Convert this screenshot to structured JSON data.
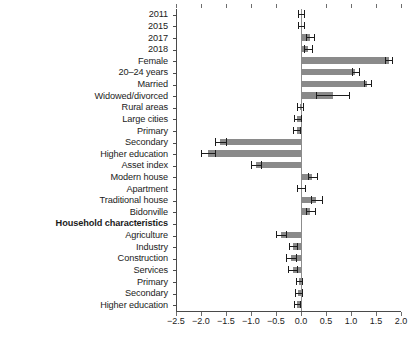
{
  "chart_data": {
    "type": "bar",
    "orientation": "horizontal",
    "title": "",
    "subtitle": "",
    "xlabel": "",
    "ylabel": "",
    "xlim": [
      -2.5,
      2.0
    ],
    "xticks": [
      -2.5,
      -2.0,
      -1.5,
      -1.0,
      -0.5,
      0.0,
      0.5,
      1.0,
      1.5,
      2.0
    ],
    "xticklabels": [
      "−2.5",
      "−2.0",
      "−1.5",
      "−1.0",
      "−0.5",
      "0.0",
      "0.5",
      "1.0",
      "1.5",
      "2.0"
    ],
    "grid": false,
    "legend": false,
    "zero_reference_line": 0.0,
    "bar_color": "#8a8a8a",
    "error_bar_color": "#1c1c1c",
    "categories": [
      "2011",
      "2015",
      "2017",
      "2018",
      "Female",
      "20–24 years",
      "Married",
      "Widowed/divorced",
      "Rural areas",
      "Large cities",
      "Primary",
      "Secondary",
      "Higher education",
      "Asset index",
      "Modern house",
      "Apartment",
      "Traditional house",
      "Bidonville",
      "Household characteristics",
      "Agriculture",
      "Industry",
      "Construction",
      "Services",
      "Primary",
      "Secondary",
      "Higher education"
    ],
    "values": [
      0.0,
      0.0,
      0.17,
      0.13,
      1.75,
      1.08,
      1.32,
      0.63,
      -0.02,
      -0.08,
      -0.09,
      -1.62,
      -1.86,
      -0.9,
      0.22,
      0.0,
      0.3,
      0.18,
      null,
      -0.4,
      -0.16,
      -0.2,
      -0.17,
      -0.04,
      -0.06,
      -0.08
    ],
    "error_low": [
      -0.07,
      -0.07,
      0.09,
      0.05,
      1.68,
      1.01,
      1.25,
      0.3,
      -0.08,
      -0.15,
      -0.16,
      -1.73,
      -2.0,
      -1.0,
      0.14,
      -0.08,
      0.2,
      0.1,
      null,
      -0.5,
      -0.24,
      -0.3,
      -0.26,
      -0.1,
      -0.13,
      -0.14
    ],
    "error_high": [
      0.05,
      0.05,
      0.25,
      0.21,
      1.82,
      1.15,
      1.39,
      0.96,
      0.04,
      -0.01,
      -0.02,
      -1.51,
      -1.72,
      -0.8,
      0.31,
      0.07,
      0.41,
      0.27,
      null,
      -0.31,
      -0.08,
      -0.11,
      -0.09,
      0.02,
      0.01,
      -0.02
    ],
    "bold_categories": [
      "Household characteristics"
    ]
  }
}
